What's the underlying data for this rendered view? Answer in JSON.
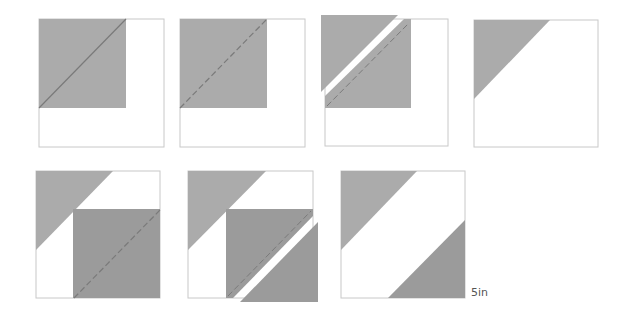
{
  "diagram": {
    "colors": {
      "background": "#ffffff",
      "outline": "#c8c8c8",
      "light_fabric": "#ababab",
      "dark_fabric": "#9b9b9b",
      "seam_line": "#7a7a7a"
    },
    "steps": [
      {
        "id": 1,
        "description": "Light square placed on top-left of base square, solid diagonal line drawn"
      },
      {
        "id": 2,
        "description": "Stitch along dashed diagonal line"
      },
      {
        "id": 3,
        "description": "Cut off corner leaving seam allowance"
      },
      {
        "id": 4,
        "description": "Press open: light triangle in top-left corner"
      },
      {
        "id": 5,
        "description": "Dark square placed on bottom-right, dashed diagonal line"
      },
      {
        "id": 6,
        "description": "Stitch and trim bottom-right corner"
      },
      {
        "id": 7,
        "description": "Finished block with two opposite corner triangles"
      }
    ],
    "size_label": "5in"
  }
}
